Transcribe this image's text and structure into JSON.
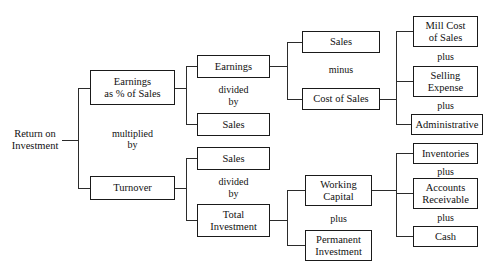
{
  "diagram": {
    "root": {
      "label": "Return on\nInvestment"
    },
    "level1": {
      "top": {
        "label": "Earnings\nas % of Sales"
      },
      "operator": {
        "label": "multiplied\nby"
      },
      "bottom": {
        "label": "Turnover"
      }
    },
    "level2_top": {
      "numerator": {
        "label": "Earnings"
      },
      "operator": {
        "label": "divided\nby"
      },
      "denominator": {
        "label": "Sales"
      }
    },
    "level2_bottom": {
      "numerator": {
        "label": "Sales"
      },
      "operator": {
        "label": "divided\nby"
      },
      "denominator": {
        "label": "Total\nInvestment"
      }
    },
    "level3_top": {
      "first": {
        "label": "Sales"
      },
      "operator": {
        "label": "minus"
      },
      "second": {
        "label": "Cost of Sales"
      }
    },
    "level3_bottom": {
      "first": {
        "label": "Working\nCapital"
      },
      "operator": {
        "label": "plus"
      },
      "second": {
        "label": "Permanent\nInvestment"
      }
    },
    "level4_top": {
      "items": [
        {
          "label": "Mill Cost\nof Sales"
        },
        {
          "label": "Selling\nExpense"
        },
        {
          "label": "Administrative"
        }
      ],
      "operators": [
        {
          "label": "plus"
        },
        {
          "label": "plus"
        }
      ]
    },
    "level4_bottom": {
      "items": [
        {
          "label": "Inventories"
        },
        {
          "label": "Accounts\nReceivable"
        },
        {
          "label": "Cash"
        }
      ],
      "operators": [
        {
          "label": "plus"
        },
        {
          "label": "plus"
        }
      ]
    },
    "colors": {
      "box_border": "#1a1a1a",
      "connector": "#2b2b2b",
      "text": "#111111",
      "background": "#ffffff"
    }
  }
}
